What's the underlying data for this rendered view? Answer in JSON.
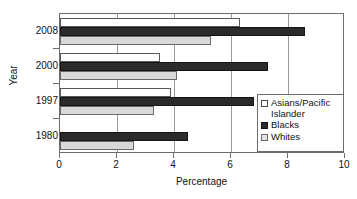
{
  "chart_data": {
    "type": "bar",
    "orientation": "horizontal",
    "title": "",
    "xlabel": "Percentage",
    "ylabel": "Year",
    "categories": [
      "2008",
      "2000",
      "1997",
      "1980"
    ],
    "xlim": [
      0,
      10
    ],
    "xticks": [
      "0",
      "2",
      "4",
      "6",
      "8",
      "10"
    ],
    "xtick_values": [
      0,
      2,
      4,
      6,
      8,
      10
    ],
    "grid": true,
    "legend_position": "right-middle",
    "series": [
      {
        "name": "Asians/Pacific Islander",
        "swatch": "asian",
        "values": [
          6.3,
          3.5,
          3.9,
          null
        ]
      },
      {
        "name": "Blacks",
        "swatch": "black",
        "values": [
          8.6,
          7.3,
          6.8,
          4.5
        ]
      },
      {
        "name": "Whites",
        "swatch": "white",
        "values": [
          5.3,
          4.1,
          3.3,
          2.6
        ]
      }
    ]
  },
  "legend": {
    "entries": [
      {
        "label": "Asians/Pacific Islander",
        "swatch": "asian"
      },
      {
        "label": "Blacks",
        "swatch": "black"
      },
      {
        "label": "Whites",
        "swatch": "white"
      }
    ]
  },
  "colors": {
    "asian": "#ffffff",
    "blacks": "#2b2b2b",
    "whites": "#d9d9d9",
    "axis": "#6d6d6d",
    "grid": "#9a9a9a",
    "text": "#111111"
  }
}
